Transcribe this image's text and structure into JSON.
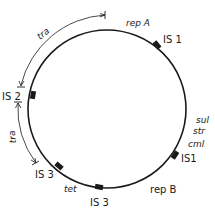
{
  "diagram": {
    "type": "plasmid-map",
    "colors": {
      "ink": "#1a1a1a",
      "background": "#ffffff"
    },
    "elements": [
      {
        "id": "is1-top",
        "label": "IS 1",
        "kind": "insertion-sequence"
      },
      {
        "id": "is1-right",
        "label": "IS1",
        "kind": "insertion-sequence"
      },
      {
        "id": "is2",
        "label": "IS 2",
        "kind": "insertion-sequence"
      },
      {
        "id": "is3-left",
        "label": "IS 3",
        "kind": "insertion-sequence"
      },
      {
        "id": "is3-bottom",
        "label": "IS 3",
        "kind": "insertion-sequence"
      }
    ],
    "genes": [
      {
        "id": "repA",
        "label": "rep A"
      },
      {
        "id": "repB",
        "label": "rep B"
      },
      {
        "id": "sul",
        "label": "sul"
      },
      {
        "id": "str",
        "label": "str"
      },
      {
        "id": "cml",
        "label": "cml"
      },
      {
        "id": "tet",
        "label": "tet"
      }
    ],
    "regions": [
      {
        "id": "tra-upper",
        "label": "tra"
      },
      {
        "id": "tra-lower",
        "label": "tra"
      }
    ]
  }
}
